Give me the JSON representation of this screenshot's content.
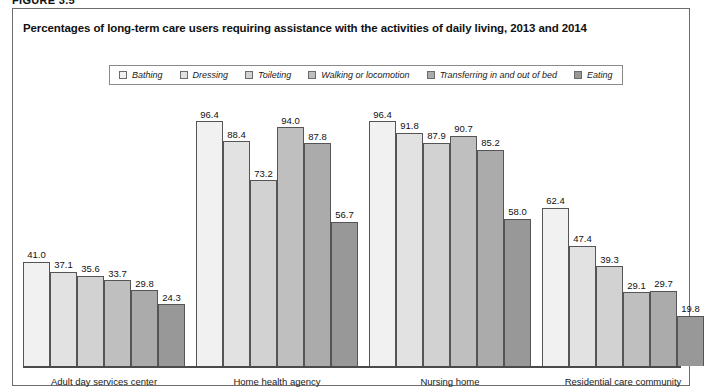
{
  "figure": {
    "label": "FIGURE 3.5"
  },
  "chart_data": {
    "type": "bar",
    "title": "Percentages of long-term care users requiring assistance with the activities of daily living, 2013 and 2014",
    "xlabel": "",
    "ylabel": "",
    "ylim": [
      0,
      100
    ],
    "grid": false,
    "legend_position": "top",
    "categories": [
      "Adult day services center",
      "Home health agency",
      "Nursing home",
      "Residential care community"
    ],
    "series": [
      {
        "name": "Bathing",
        "color": "#f1f1f1",
        "values": [
          41.0,
          96.4,
          96.4,
          62.4
        ]
      },
      {
        "name": "Dressing",
        "color": "#e2e2e2",
        "values": [
          37.1,
          88.4,
          91.8,
          47.4
        ]
      },
      {
        "name": "Toileting",
        "color": "#d2d2d2",
        "values": [
          35.6,
          73.2,
          87.9,
          39.3
        ]
      },
      {
        "name": "Walking or locomotion",
        "color": "#bfbfbf",
        "values": [
          33.7,
          94.0,
          90.7,
          29.1
        ]
      },
      {
        "name": "Transferring in and out of bed",
        "color": "#ababab",
        "values": [
          29.8,
          87.8,
          85.2,
          29.7
        ]
      },
      {
        "name": "Eating",
        "color": "#989898",
        "values": [
          24.3,
          56.7,
          58.0,
          19.8
        ]
      }
    ],
    "value_labels": [
      [
        "41.0",
        "37.1",
        "35.6",
        "33.7",
        "29.8",
        "24.3"
      ],
      [
        "96.4",
        "88.4",
        "73.2",
        "94.0",
        "87.8",
        "56.7"
      ],
      [
        "96.4",
        "91.8",
        "87.9",
        "90.7",
        "85.2",
        "58.0"
      ],
      [
        "62.4",
        "47.4",
        "39.3",
        "29.1",
        "29.7",
        "19.8"
      ]
    ]
  }
}
